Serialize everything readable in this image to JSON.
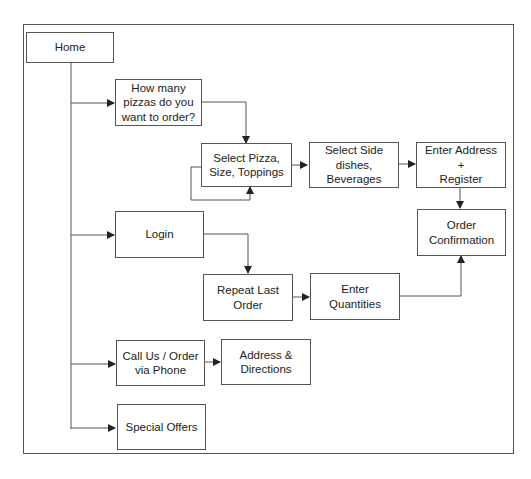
{
  "diagram": {
    "nodes": {
      "home": "Home",
      "how_many": "How many\npizzas do you\nwant to order?",
      "select_pizza": "Select Pizza,\nSize, Toppings",
      "select_side": "Select Side\ndishes,\nBeverages",
      "enter_address": "Enter Address +\nRegister",
      "order_confirmation": "Order\nConfirmation",
      "login": "Login",
      "repeat_last": "Repeat Last\nOrder",
      "enter_quantities": "Enter Quantities",
      "call_us": "Call Us / Order\nvia Phone",
      "address_directions": "Address &\nDirections",
      "special_offers": "Special Offers"
    },
    "edges": [
      {
        "from": "home",
        "to": "how_many"
      },
      {
        "from": "home",
        "to": "login"
      },
      {
        "from": "home",
        "to": "call_us"
      },
      {
        "from": "home",
        "to": "special_offers"
      },
      {
        "from": "how_many",
        "to": "select_pizza"
      },
      {
        "from": "select_pizza",
        "to": "select_pizza"
      },
      {
        "from": "select_pizza",
        "to": "select_side"
      },
      {
        "from": "select_side",
        "to": "enter_address"
      },
      {
        "from": "enter_address",
        "to": "order_confirmation"
      },
      {
        "from": "login",
        "to": "repeat_last"
      },
      {
        "from": "repeat_last",
        "to": "enter_quantities"
      },
      {
        "from": "enter_quantities",
        "to": "order_confirmation"
      },
      {
        "from": "call_us",
        "to": "address_directions"
      }
    ]
  }
}
